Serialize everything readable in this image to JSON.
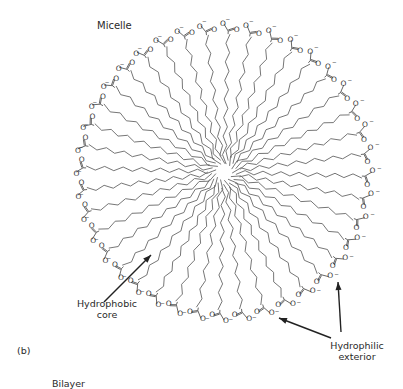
{
  "figure": {
    "title": "Micelle",
    "panel_label": "(b)",
    "next_title": "Bilayer",
    "annotations": [
      {
        "id": "core",
        "lines": [
          "Hydrophobic",
          "core"
        ]
      },
      {
        "id": "exterior",
        "lines": [
          "Hydrophilic",
          "exterior"
        ]
      }
    ]
  },
  "micelle": {
    "center": [
      224,
      172
    ],
    "head_radius": 150,
    "tail_inner_radius": 8,
    "chain_count": 40,
    "zigzag_amplitude": 4,
    "head_group": {
      "carbonyl_oxygen": "O",
      "anion_oxygen": "O",
      "charge": "−"
    },
    "colors": {
      "chain": "#666666",
      "text": "#333333",
      "arrow": "#222222"
    }
  },
  "arrows": [
    {
      "name": "hydrophobic-core-arrow",
      "from": [
        104,
        302
      ],
      "to": [
        151,
        255
      ]
    },
    {
      "name": "hydrophilic-exterior-arrow-1",
      "from": [
        331,
        338
      ],
      "to": [
        279,
        318
      ]
    },
    {
      "name": "hydrophilic-exterior-arrow-2",
      "from": [
        341,
        332
      ],
      "to": [
        338,
        282
      ]
    }
  ]
}
